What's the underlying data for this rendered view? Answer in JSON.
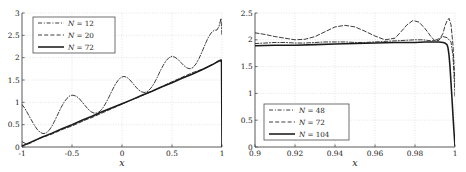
{
  "figure": {
    "background_color": "#ffffff",
    "axis_color": "#4d4d4d",
    "grid_color": "#c8c8c8",
    "curve_color": "#1a1a1a",
    "panel_count": 2
  },
  "chart_data": [
    {
      "type": "line",
      "panel": "left",
      "title": "",
      "xlabel": "x",
      "ylabel": "",
      "xlim": [
        -1,
        1
      ],
      "ylim": [
        0,
        3
      ],
      "grid": true,
      "xticks": [
        -1,
        -0.5,
        0,
        0.5,
        1
      ],
      "xticklabels": [
        "-1",
        "-0.5",
        "0",
        "0.5",
        "1"
      ],
      "yticks": [
        0,
        0.5,
        1,
        1.5,
        2,
        2.5,
        3
      ],
      "yticklabels": [
        "0",
        "0.5",
        "1",
        "1.5",
        "2",
        "2.5",
        "3"
      ],
      "legend_position": "upper left",
      "series": [
        {
          "name": "N = 12",
          "label_prefix": "N",
          "label_eq": "=",
          "label_value": "12",
          "style": "dashdot",
          "x": [
            -1.0,
            -0.97,
            -0.94,
            -0.91,
            -0.88,
            -0.85,
            -0.82,
            -0.79,
            -0.76,
            -0.73,
            -0.7,
            -0.67,
            -0.64,
            -0.61,
            -0.58,
            -0.55,
            -0.52,
            -0.49,
            -0.46,
            -0.43,
            -0.4,
            -0.37,
            -0.34,
            -0.31,
            -0.28,
            -0.25,
            -0.22,
            -0.19,
            -0.16,
            -0.13,
            -0.1,
            -0.07,
            -0.04,
            -0.01,
            0.02,
            0.05,
            0.08,
            0.11,
            0.14,
            0.17,
            0.2,
            0.23,
            0.26,
            0.29,
            0.32,
            0.35,
            0.38,
            0.41,
            0.44,
            0.47,
            0.5,
            0.53,
            0.56,
            0.59,
            0.62,
            0.65,
            0.68,
            0.71,
            0.74,
            0.77,
            0.8,
            0.83,
            0.86,
            0.89,
            0.92,
            0.95,
            0.97,
            0.99,
            1.0
          ],
          "y": [
            0.95,
            0.86,
            0.74,
            0.62,
            0.5,
            0.4,
            0.33,
            0.3,
            0.31,
            0.37,
            0.47,
            0.6,
            0.74,
            0.88,
            1.0,
            1.09,
            1.15,
            1.16,
            1.14,
            1.09,
            1.01,
            0.93,
            0.85,
            0.79,
            0.76,
            0.76,
            0.8,
            0.88,
            0.99,
            1.12,
            1.26,
            1.39,
            1.49,
            1.56,
            1.58,
            1.56,
            1.5,
            1.42,
            1.34,
            1.27,
            1.23,
            1.22,
            1.25,
            1.32,
            1.42,
            1.55,
            1.69,
            1.82,
            1.93,
            2.0,
            2.03,
            2.01,
            1.96,
            1.89,
            1.82,
            1.77,
            1.75,
            1.78,
            1.86,
            1.98,
            2.13,
            2.29,
            2.44,
            2.55,
            2.61,
            2.62,
            2.7,
            2.88,
            2.5
          ]
        },
        {
          "name": "N = 20",
          "label_prefix": "N",
          "label_eq": "=",
          "label_value": "20",
          "style": "dashed",
          "x": [
            -1.0,
            -0.95,
            -0.9,
            -0.85,
            -0.8,
            -0.75,
            -0.7,
            -0.65,
            -0.6,
            -0.55,
            -0.5,
            -0.45,
            -0.4,
            -0.35,
            -0.3,
            -0.25,
            -0.2,
            -0.15,
            -0.1,
            -0.05,
            0.0,
            0.05,
            0.1,
            0.15,
            0.2,
            0.25,
            0.3,
            0.35,
            0.4,
            0.45,
            0.5,
            0.55,
            0.6,
            0.65,
            0.7,
            0.75,
            0.8,
            0.85,
            0.9,
            0.94,
            0.97,
            1.0
          ],
          "y": [
            0.12,
            0.06,
            0.1,
            0.17,
            0.22,
            0.25,
            0.29,
            0.34,
            0.39,
            0.43,
            0.47,
            0.52,
            0.57,
            0.62,
            0.66,
            0.71,
            0.76,
            0.81,
            0.86,
            0.91,
            0.96,
            1.01,
            1.06,
            1.1,
            1.15,
            1.2,
            1.25,
            1.3,
            1.35,
            1.41,
            1.46,
            1.51,
            1.56,
            1.61,
            1.66,
            1.7,
            1.74,
            1.78,
            1.84,
            1.9,
            1.94,
            1.9
          ]
        },
        {
          "name": "N = 72",
          "label_prefix": "N",
          "label_eq": "=",
          "label_value": "72",
          "style": "solid",
          "x": [
            -1.0,
            -0.9,
            -0.8,
            -0.7,
            -0.6,
            -0.5,
            -0.4,
            -0.3,
            -0.2,
            -0.1,
            0.0,
            0.1,
            0.2,
            0.3,
            0.4,
            0.5,
            0.6,
            0.7,
            0.8,
            0.9,
            0.95,
            0.975,
            0.99,
            0.995,
            1.0
          ],
          "y": [
            0.02,
            0.12,
            0.22,
            0.31,
            0.41,
            0.5,
            0.6,
            0.69,
            0.79,
            0.88,
            0.97,
            1.06,
            1.16,
            1.25,
            1.35,
            1.44,
            1.54,
            1.63,
            1.73,
            1.84,
            1.9,
            1.93,
            1.95,
            1.93,
            0.0
          ]
        }
      ]
    },
    {
      "type": "line",
      "panel": "right",
      "title": "",
      "xlabel": "x",
      "ylabel": "",
      "xlim": [
        0.9,
        1.0
      ],
      "ylim": [
        0,
        2.5
      ],
      "grid": true,
      "xticks": [
        0.9,
        0.92,
        0.94,
        0.96,
        0.98,
        1.0
      ],
      "xticklabels": [
        "0.9",
        "0.92",
        "0.94",
        "0.96",
        "0.98",
        "1"
      ],
      "yticks": [
        0,
        0.5,
        1,
        1.5,
        2,
        2.5
      ],
      "yticklabels": [
        "0",
        "0.5",
        "1",
        "1.5",
        "2",
        "2.5"
      ],
      "legend_position": "lower left",
      "series": [
        {
          "name": "N = 48",
          "label_prefix": "N",
          "label_eq": "=",
          "label_value": "48",
          "style": "dashdot",
          "x": [
            0.9,
            0.905,
            0.91,
            0.915,
            0.92,
            0.925,
            0.93,
            0.935,
            0.94,
            0.945,
            0.95,
            0.955,
            0.96,
            0.965,
            0.97,
            0.975,
            0.98,
            0.982,
            0.984,
            0.986,
            0.988,
            0.99,
            0.992,
            0.994,
            0.996,
            0.998,
            0.999,
            1.0
          ],
          "y": [
            1.93,
            1.94,
            1.95,
            1.95,
            1.94,
            1.94,
            1.95,
            1.96,
            1.96,
            1.96,
            1.95,
            1.95,
            1.96,
            1.97,
            1.98,
            1.99,
            2.0,
            2.0,
            2.0,
            1.99,
            1.98,
            1.99,
            2.02,
            2.06,
            2.04,
            1.96,
            1.7,
            0.95
          ]
        },
        {
          "name": "N = 72",
          "label_prefix": "N",
          "label_eq": "=",
          "label_value": "72",
          "style": "dashed",
          "x": [
            0.9,
            0.905,
            0.91,
            0.915,
            0.92,
            0.925,
            0.93,
            0.935,
            0.94,
            0.945,
            0.95,
            0.955,
            0.96,
            0.965,
            0.97,
            0.973,
            0.976,
            0.979,
            0.982,
            0.985,
            0.988,
            0.99,
            0.992,
            0.994,
            0.995,
            0.996,
            0.997,
            0.998,
            0.999,
            1.0
          ],
          "y": [
            2.13,
            2.1,
            2.06,
            2.03,
            2.0,
            2.01,
            2.06,
            2.15,
            2.24,
            2.27,
            2.24,
            2.16,
            2.07,
            2.0,
            2.03,
            2.15,
            2.28,
            2.36,
            2.33,
            2.21,
            2.06,
            1.98,
            1.99,
            2.12,
            2.26,
            2.35,
            2.4,
            2.28,
            1.9,
            1.2
          ]
        },
        {
          "name": "N = 104",
          "label_prefix": "N",
          "label_eq": "=",
          "label_value": "104",
          "style": "solid",
          "x": [
            0.9,
            0.91,
            0.92,
            0.93,
            0.94,
            0.95,
            0.96,
            0.97,
            0.98,
            0.985,
            0.99,
            0.992,
            0.994,
            0.995,
            0.996,
            0.9965,
            0.997,
            0.9975,
            0.998,
            0.9985,
            0.999,
            0.9995,
            1.0
          ],
          "y": [
            1.89,
            1.9,
            1.9,
            1.91,
            1.92,
            1.93,
            1.94,
            1.95,
            1.95,
            1.96,
            1.96,
            1.96,
            1.95,
            1.94,
            1.91,
            1.85,
            1.72,
            1.5,
            1.2,
            0.9,
            0.58,
            0.28,
            0.02
          ]
        }
      ]
    }
  ]
}
